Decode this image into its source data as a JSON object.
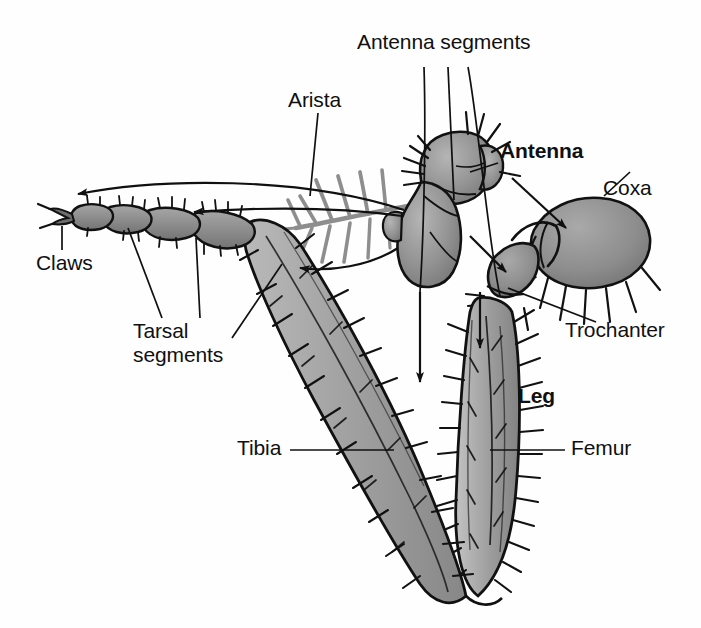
{
  "figure": {
    "background_color": "#fefefe",
    "ink_color": "#101010",
    "body_fill_light": "#bdbdbd",
    "body_fill_mid": "#9a9a9a",
    "body_fill_dark": "#7c7c7c",
    "arista_color": "#8e8e8e"
  },
  "labels": {
    "antenna_segments": "Antenna segments",
    "arista": "Arista",
    "antenna": "Antenna",
    "coxa": "Coxa",
    "trochanter": "Trochanter",
    "claws": "Claws",
    "tarsal_segments": "Tarsal\nsegments",
    "tarsal_segments_line1": "Tarsal",
    "tarsal_segments_line2": "segments",
    "tibia": "Tibia",
    "femur": "Femur",
    "leg": "Leg"
  },
  "structures": [
    {
      "name": "antenna-upper-segment",
      "label": "Antenna segment (pedicel)"
    },
    {
      "name": "antenna-lower-segment",
      "label": "Antenna segment (funiculus)"
    },
    {
      "name": "arista-bristle",
      "label": "Arista"
    },
    {
      "name": "coxa-segment",
      "label": "Coxa"
    },
    {
      "name": "trochanter-segment",
      "label": "Trochanter"
    },
    {
      "name": "femur-segment",
      "label": "Femur"
    },
    {
      "name": "tibia-segment",
      "label": "Tibia"
    },
    {
      "name": "tarsus-segment",
      "label": "Tarsal segments"
    },
    {
      "name": "claw-tip",
      "label": "Claws"
    }
  ]
}
